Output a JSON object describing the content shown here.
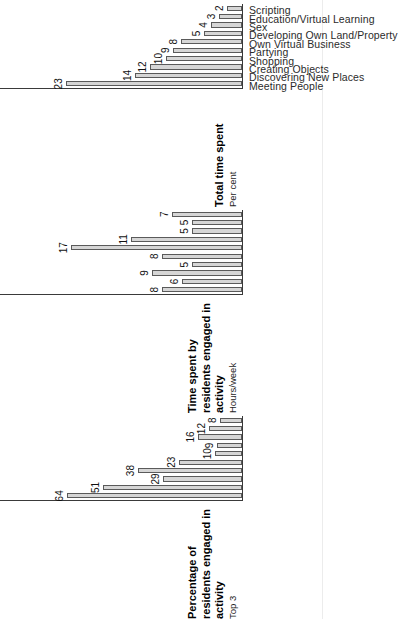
{
  "chart_data": {
    "type": "bar",
    "title": "",
    "orientation": "rotated-90-ccw",
    "grid": false,
    "legend": "none",
    "categories": [
      "Meeting People",
      "Discovering New Places",
      "Creating Objects",
      "Shopping",
      "Partying",
      "Own Virtual Business",
      "Developing Own Land/Property",
      "Sex",
      "Education/Virtual Learning",
      "Scripting"
    ],
    "panels": [
      {
        "id": "percentage-of-residents",
        "title": "Percentage of residents engaged in activity",
        "subtitle": "Top 3",
        "ylabel": "Top 3",
        "values": [
          64,
          51,
          29,
          38,
          23,
          10,
          9,
          16,
          12,
          8
        ],
        "ylim": [
          0,
          70
        ]
      },
      {
        "id": "time-spent",
        "title": "Time spent by residents engaged in activity",
        "subtitle": "Hours/week",
        "ylabel": "Hours/week",
        "values": [
          8,
          6,
          9,
          5,
          8,
          17,
          11,
          5,
          5,
          7
        ],
        "ylim": [
          0,
          19
        ]
      },
      {
        "id": "total-time-spent",
        "title": "Total time spent",
        "subtitle": "Per cent",
        "ylabel": "Per cent",
        "values": [
          23,
          14,
          12,
          10,
          9,
          8,
          5,
          4,
          3,
          2
        ],
        "ylim": [
          0,
          25
        ]
      }
    ]
  },
  "colors": {
    "bar_fill": "#d6d6d6",
    "bar_stroke": "#5a5a5a",
    "axis": "#3a3a3a",
    "text": "#111111",
    "background": "#ffffff"
  }
}
